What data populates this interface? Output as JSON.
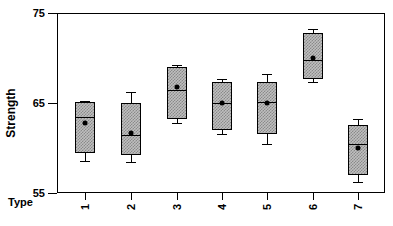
{
  "chart_data": {
    "type": "box",
    "title": "",
    "xlabel": "Type",
    "ylabel": "Strength",
    "categories": [
      "1",
      "2",
      "3",
      "4",
      "5",
      "6",
      "7"
    ],
    "ylim": [
      55,
      75
    ],
    "yticks": [
      55,
      65,
      75
    ],
    "ytick_labels": [
      "55",
      "65",
      "75"
    ],
    "grid": false,
    "legend": null,
    "box_fill_color": "#bfbfbf",
    "box_fill_pattern": "checkerboard-hatch",
    "line_color": "#000000",
    "mean_marker": "filled-circle",
    "boxes": [
      {
        "category": "1",
        "whisker_high": 65.2,
        "q3": 65.1,
        "median": 63.4,
        "q1": 59.4,
        "whisker_low": 58.6,
        "mean": 62.8
      },
      {
        "category": "2",
        "whisker_high": 66.2,
        "q3": 65.0,
        "median": 61.4,
        "q1": 59.2,
        "whisker_low": 58.4,
        "mean": 61.7
      },
      {
        "category": "3",
        "whisker_high": 69.2,
        "q3": 69.0,
        "median": 66.5,
        "q1": 63.2,
        "whisker_low": 62.8,
        "mean": 66.8
      },
      {
        "category": "4",
        "whisker_high": 67.7,
        "q3": 67.3,
        "median": 65.0,
        "q1": 62.0,
        "whisker_low": 61.6,
        "mean": 65.0
      },
      {
        "category": "5",
        "whisker_high": 68.2,
        "q3": 67.3,
        "median": 65.1,
        "q1": 61.5,
        "whisker_low": 60.4,
        "mean": 65.0
      },
      {
        "category": "6",
        "whisker_high": 73.2,
        "q3": 72.8,
        "median": 69.8,
        "q1": 67.7,
        "whisker_low": 67.3,
        "mean": 70.0
      },
      {
        "category": "7",
        "whisker_high": 63.2,
        "q3": 62.6,
        "median": 60.5,
        "q1": 57.0,
        "whisker_low": 56.2,
        "mean": 60.0
      }
    ]
  },
  "geometry": {
    "plot_left": 57,
    "plot_top": 13,
    "plot_width": 328,
    "plot_height": 180,
    "value_top": 75,
    "value_bottom": 55,
    "box_width": 20,
    "cap_width": 10,
    "tick_x": [
      85,
      131,
      177,
      222,
      267,
      313,
      358
    ]
  }
}
